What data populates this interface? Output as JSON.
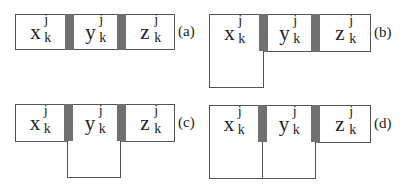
{
  "figure": {
    "variables": [
      {
        "base": "x",
        "superscript": "j",
        "subscript": "k"
      },
      {
        "base": "y",
        "superscript": "j",
        "subscript": "k"
      },
      {
        "base": "z",
        "superscript": "j",
        "subscript": "k"
      }
    ],
    "panels": [
      {
        "label": "(a)",
        "extension": "none"
      },
      {
        "label": "(b)",
        "extension": "below-x"
      },
      {
        "label": "(c)",
        "extension": "below-y"
      },
      {
        "label": "(d)",
        "extension": "below-x-and-y"
      }
    ],
    "colors": {
      "separator": "#707070",
      "border": "#555555",
      "background": "#ffffff"
    }
  }
}
